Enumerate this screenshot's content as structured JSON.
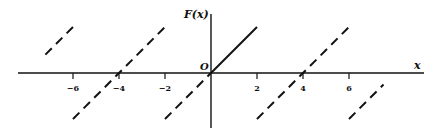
{
  "chart_data": {
    "type": "line",
    "title": "",
    "xlabel": "x",
    "ylabel": "F(x)",
    "origin_label": "O",
    "xlim": [
      -8.7,
      9.2
    ],
    "ylim": [
      -2.6,
      3.2
    ],
    "grid": false,
    "xticks": [
      -6,
      -4,
      -2,
      2,
      4,
      6
    ],
    "xtick_labels": [
      "−6",
      "−4",
      "−2",
      "2",
      "4",
      "6"
    ],
    "series": [
      {
        "name": "F(x) = x on [0,2]",
        "style": "solid",
        "points": [
          [
            0,
            0
          ],
          [
            2,
            2
          ]
        ]
      },
      {
        "name": "extension on [-2,0]",
        "style": "dashed",
        "points": [
          [
            -2,
            -2
          ],
          [
            0,
            0
          ]
        ]
      },
      {
        "name": "periodic copy (-6,-2)",
        "style": "dashed",
        "points": [
          [
            -6,
            -2
          ],
          [
            -2,
            2
          ]
        ]
      },
      {
        "name": "periodic copy partial left",
        "style": "dashed",
        "points": [
          [
            -7.2,
            0.8
          ],
          [
            -6,
            2
          ]
        ]
      },
      {
        "name": "periodic copy (2,6)",
        "style": "dashed",
        "points": [
          [
            2,
            -2
          ],
          [
            6,
            2
          ]
        ]
      },
      {
        "name": "periodic copy partial right",
        "style": "dashed",
        "points": [
          [
            6,
            -2
          ],
          [
            7.5,
            -0.5
          ]
        ]
      }
    ]
  },
  "layout": {
    "origin_px": [
      211,
      73
    ],
    "unit_px": 23
  }
}
